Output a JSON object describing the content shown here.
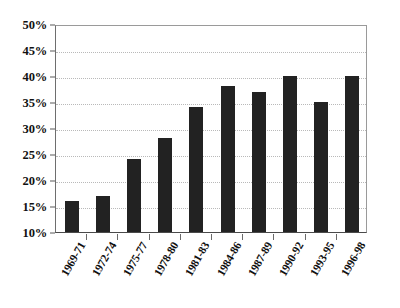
{
  "chart_data": {
    "type": "bar",
    "title": "",
    "subtitle": "",
    "xlabel": "",
    "ylabel": "",
    "categories": [
      "1969-71",
      "1972-74",
      "1975-77",
      "1978-80",
      "1981-83",
      "1984-86",
      "1987-89",
      "1990-92",
      "1993-95",
      "1996-98"
    ],
    "values": [
      16,
      17,
      24,
      28,
      34,
      38,
      37,
      40,
      35,
      40
    ],
    "value_suffix": "%",
    "ylim": [
      10,
      50
    ],
    "ytick_step": 5,
    "ytick_labels": [
      "50%",
      "45%",
      "40%",
      "35%",
      "30%",
      "25%",
      "20%",
      "15%",
      "10%"
    ],
    "ytick_values": [
      50,
      45,
      40,
      35,
      30,
      25,
      20,
      15,
      10
    ],
    "grid": true,
    "grid_axis": "y",
    "grid_style": "dotted",
    "legend": false,
    "legend_position": "none",
    "bar_color": "#222222",
    "grid_color": "#b9b9b9",
    "axis_color": "#4a4a4a",
    "background_color": "#ffffff",
    "xtick_label_rotation": -60,
    "series": [
      {
        "name": "",
        "values": [
          16,
          17,
          24,
          28,
          34,
          38,
          37,
          40,
          35,
          40
        ]
      }
    ]
  }
}
